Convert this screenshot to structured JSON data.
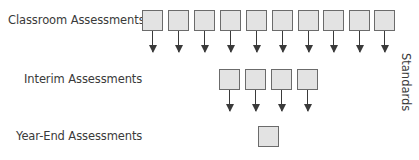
{
  "rows": [
    {
      "label": "Classroom Assessments",
      "box_count": 10
    },
    {
      "label": "Interim Assessments",
      "box_count": 4
    },
    {
      "label": "Year-End Assessments",
      "box_count": 1
    }
  ],
  "side_label": "Standards",
  "colors": {
    "box_fill": "#e3e3e3",
    "box_border": "#6b6b6b",
    "arrow": "#3a3a3a",
    "text": "#3a3a3a"
  }
}
